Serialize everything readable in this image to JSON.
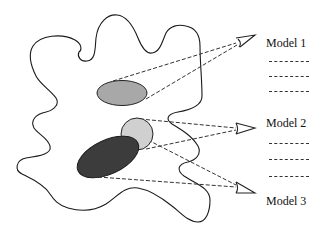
{
  "diagram": {
    "type": "multi-view modeling illustration",
    "region": {
      "shape": "irregular blob outline",
      "stroke": "#222222",
      "fill": "#ffffff"
    },
    "objects": [
      {
        "id": "object-1",
        "shape": "ellipse",
        "fill": "#a9a9a9"
      },
      {
        "id": "object-2",
        "shape": "circle",
        "fill": "#cfcfcf"
      },
      {
        "id": "object-3",
        "shape": "ellipse",
        "fill": "#3d3d3d"
      }
    ],
    "viewers": [
      {
        "id": "eye-1",
        "target_label": "Model 1"
      },
      {
        "id": "eye-2",
        "target_label": "Model 2"
      },
      {
        "id": "eye-3",
        "target_label": "Model 3"
      }
    ],
    "connections": [
      {
        "from": "object-1",
        "to": "eye-1",
        "style": "dashed"
      },
      {
        "from": "object-2",
        "to": "eye-2",
        "style": "dashed"
      },
      {
        "from": "object-3",
        "to": "eye-2",
        "style": "dashed"
      },
      {
        "from": "object-2",
        "to": "eye-3",
        "style": "dashed"
      },
      {
        "from": "object-3",
        "to": "eye-3",
        "style": "dashed"
      }
    ]
  },
  "models": [
    {
      "label": "Model 1",
      "lines": [
        "----------",
        "----------",
        "----------"
      ]
    },
    {
      "label": "Model 2",
      "lines": [
        "----------",
        "----------",
        "----------"
      ]
    },
    {
      "label": "Model 3",
      "lines": []
    }
  ]
}
